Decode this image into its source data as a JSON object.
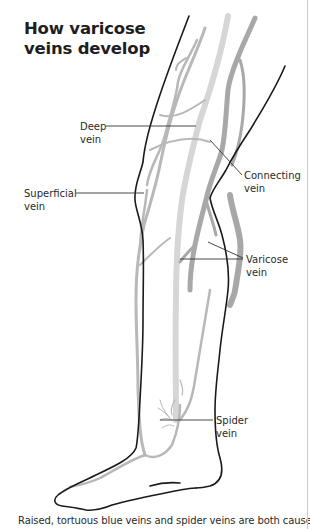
{
  "title": "How varicose\nveins develop",
  "labels": {
    "deep_vein": "Deep\nvein",
    "connecting_vein": "Connecting\nvein",
    "superficial_vein": "Superficial\nvein",
    "varicose_vein": "Varicose\nvein",
    "spider_vein": "Spider\nvein"
  },
  "caption": "Raised, tortuous blue veins and spider veins are both caused",
  "colors": {
    "outline": "#1a1a1a",
    "deep_vein": "#d4d4d4",
    "superficial_vein": "#b3b3b3",
    "varicose_vein": "#a8a8a8",
    "leader_line": "#333333",
    "border": "#c8c8c8"
  }
}
